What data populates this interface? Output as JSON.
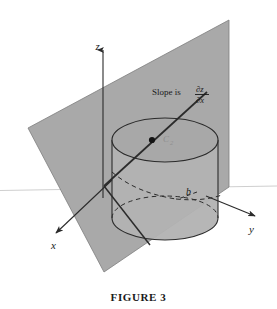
{
  "figure": {
    "caption": "FIGURE 3",
    "annotation_text": "Slope is",
    "fraction": {
      "numerator": "∂z",
      "denominator": "∂x"
    },
    "axes": {
      "z_label": "z",
      "x_label": "x",
      "y_label": "y"
    },
    "labels": {
      "point_b": "b",
      "curve_c": "C",
      "curve_c_subscript": "2"
    },
    "colors": {
      "plane_fill": "#a9a9a9",
      "cylinder_fill": "#b2b2b2",
      "cylinder_top_fill": "#a3a3a3",
      "stroke": "#2b2b2b",
      "horizon_line": "#c9c9c9",
      "background": "#ffffff",
      "faint_text": "#8f8f8f"
    },
    "geometry": {
      "plane_corners": "28,128 229,20 229,187 104,272",
      "cylinder_center_top": "165,140",
      "cylinder_radius_x": 53,
      "cylinder_radius_y": 22,
      "cylinder_height": 78,
      "tangent_point": "152,140",
      "horizon_y": 190
    }
  }
}
